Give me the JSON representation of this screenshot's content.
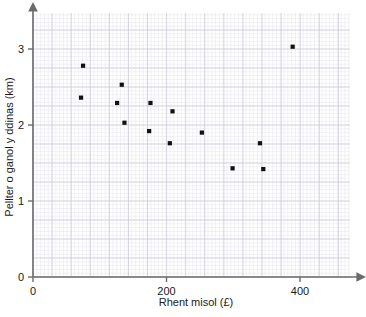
{
  "chart_data": {
    "type": "scatter",
    "title": "",
    "xlabel": "Rhent misol (£)",
    "ylabel": "Pellter o ganol y ddinas (km)",
    "xlim": [
      0,
      460
    ],
    "ylim": [
      0,
      3.5
    ],
    "xticks": [
      0,
      200,
      400
    ],
    "xtick_labels": [
      "0",
      "200",
      "400"
    ],
    "yticks": [
      0,
      1,
      2,
      3
    ],
    "ytick_labels": [
      "0",
      "1",
      "2",
      "3"
    ],
    "grid": true,
    "grid_minor_step_x": 5.7,
    "grid_minor_step_y": 0.05,
    "grid_major_step_x": 28.6,
    "grid_major_step_y": 0.25,
    "legend": "none",
    "marker": "filled-square",
    "marker_color": "#111111",
    "points": [
      {
        "x": 75,
        "y": 2.78
      },
      {
        "x": 72,
        "y": 2.36
      },
      {
        "x": 133,
        "y": 2.53
      },
      {
        "x": 126,
        "y": 2.29
      },
      {
        "x": 176,
        "y": 2.29
      },
      {
        "x": 137,
        "y": 2.03
      },
      {
        "x": 174,
        "y": 1.92
      },
      {
        "x": 209,
        "y": 2.18
      },
      {
        "x": 205,
        "y": 1.76
      },
      {
        "x": 253,
        "y": 1.9
      },
      {
        "x": 299,
        "y": 1.43
      },
      {
        "x": 340,
        "y": 1.76
      },
      {
        "x": 345,
        "y": 1.42
      },
      {
        "x": 389,
        "y": 3.03
      }
    ]
  },
  "axes": {
    "x_axis_name": "x-axis",
    "y_axis_name": "y-axis",
    "origin_label": "0"
  },
  "clipped_header": {
    "text": ""
  },
  "colors": {
    "marker": "#111111",
    "axis": "#6b6b6b",
    "grid_minor": "#e7e7ef",
    "grid_major": "#c9c9d6",
    "text": "#1a1a1a",
    "background": "#ffffff"
  }
}
